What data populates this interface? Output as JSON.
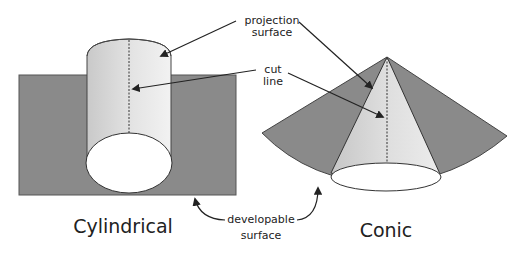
{
  "diagram": {
    "labels": {
      "projection_surface_line1": "projection",
      "projection_surface_line2": "surface",
      "cut_line_line1": "cut",
      "cut_line_line2": "line",
      "developable_surface_line1": "developable",
      "developable_surface_line2": "surface",
      "cylindrical": "Cylindrical",
      "conic": "Conic"
    },
    "colors": {
      "developable_surface": "#8a8a8a",
      "projection_surface_light": "#e6e6e6",
      "projection_surface_shade": "#c4c4c4",
      "outline": "#333333",
      "background": "#ffffff"
    }
  }
}
